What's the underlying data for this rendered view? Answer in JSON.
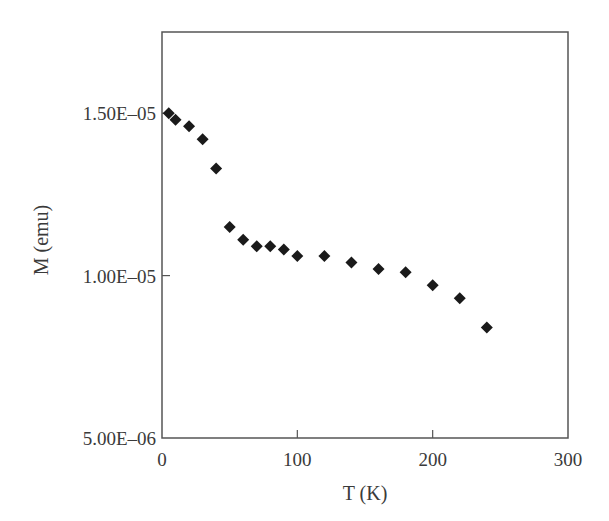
{
  "chart_data": {
    "type": "scatter",
    "title": "",
    "xlabel": "T (K)",
    "ylabel": "M (emu)",
    "xlim": [
      0,
      300
    ],
    "ylim": [
      5e-06,
      1.75e-05
    ],
    "x_ticks": [
      0,
      100,
      200,
      300
    ],
    "x_tick_labels": [
      "0",
      "100",
      "200",
      "300"
    ],
    "y_ticks": [
      5e-06,
      1e-05,
      1.5e-05
    ],
    "y_tick_labels": [
      "5.00E–06",
      "1.00E–05",
      "1.50E–05"
    ],
    "grid": false,
    "legend": null,
    "marker": "diamond",
    "marker_color": "#1a1a1a",
    "series": [
      {
        "name": "M vs T",
        "x": [
          5,
          10,
          20,
          30,
          40,
          50,
          60,
          70,
          80,
          90,
          100,
          120,
          140,
          160,
          180,
          200,
          220,
          240
        ],
        "y": [
          1.5e-05,
          1.48e-05,
          1.46e-05,
          1.42e-05,
          1.33e-05,
          1.15e-05,
          1.11e-05,
          1.09e-05,
          1.09e-05,
          1.08e-05,
          1.06e-05,
          1.06e-05,
          1.04e-05,
          1.02e-05,
          1.01e-05,
          9.7e-06,
          9.3e-06,
          8.4e-06
        ]
      }
    ]
  }
}
